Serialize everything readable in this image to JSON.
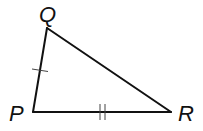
{
  "figure": {
    "type": "triangle",
    "name": "triangle PQR",
    "vertices": [
      {
        "id": "Q",
        "label": "Q"
      },
      {
        "id": "P",
        "label": "P"
      },
      {
        "id": "R",
        "label": "R"
      }
    ],
    "sides": [
      {
        "id": "PQ",
        "from": "P",
        "to": "Q",
        "congruence_marks": 1
      },
      {
        "id": "PR",
        "from": "P",
        "to": "R",
        "congruence_marks": 2
      },
      {
        "id": "QR",
        "from": "Q",
        "to": "R",
        "congruence_marks": 0
      }
    ],
    "colors": {
      "stroke": "#111111",
      "background": "#ffffff"
    }
  }
}
